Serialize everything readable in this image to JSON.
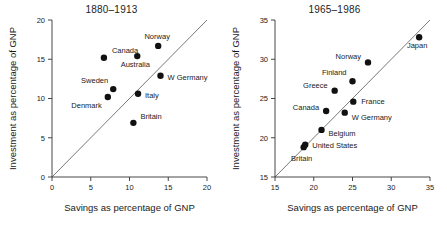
{
  "figure": {
    "background": "#ffffff",
    "point_color": "#111111",
    "axis_color": "#333333",
    "diagonal_color": "#555555"
  },
  "chart_data": [
    {
      "type": "scatter",
      "title": "1880–1913",
      "xlabel": "Savings as percentage of GNP",
      "ylabel": "Investment as percentage of GNP",
      "xlim": [
        0,
        20
      ],
      "ylim": [
        0,
        20
      ],
      "xticks": [
        0,
        5,
        10,
        15,
        20
      ],
      "yticks": [
        0,
        5,
        10,
        15,
        20
      ],
      "xtick_labels": [
        "0",
        "5",
        "10",
        "15",
        "20"
      ],
      "ytick_labels": [
        "0",
        "5",
        "10",
        "15",
        "20"
      ],
      "grid": false,
      "legend": "none",
      "annotations": [
        {
          "text": "45-degree reference line",
          "type": "identity-line",
          "from": [
            0,
            0
          ],
          "to": [
            20,
            20
          ]
        }
      ],
      "points": [
        {
          "label": "Canada",
          "x": 6.7,
          "y": 15.2,
          "label_dx": 8,
          "label_dy": -5,
          "anchor": "start"
        },
        {
          "label": "Denmark",
          "x": 7.2,
          "y": 10.2,
          "label_dx": -6,
          "label_dy": 11,
          "anchor": "end"
        },
        {
          "label": "Sweden",
          "x": 7.9,
          "y": 11.2,
          "label_dx": -5,
          "label_dy": -6,
          "anchor": "end"
        },
        {
          "label": "Australia",
          "x": 11.0,
          "y": 15.4,
          "label_dx": -2,
          "label_dy": 11,
          "anchor": "middle"
        },
        {
          "label": "Italy",
          "x": 11.1,
          "y": 10.6,
          "label_dx": 7,
          "label_dy": 4,
          "anchor": "start"
        },
        {
          "label": "Britain",
          "x": 10.5,
          "y": 6.9,
          "label_dx": 7,
          "label_dy": -4,
          "anchor": "start"
        },
        {
          "label": "Norway",
          "x": 13.7,
          "y": 16.7,
          "label_dx": -1,
          "label_dy": -7,
          "anchor": "middle"
        },
        {
          "label": "W Germany",
          "x": 14.0,
          "y": 12.9,
          "label_dx": 7,
          "label_dy": 4,
          "anchor": "start"
        }
      ]
    },
    {
      "type": "scatter",
      "title": "1965–1986",
      "xlabel": "Savings as percentage of GNP",
      "ylabel": "Investment as percentage of GNP",
      "xlim": [
        15,
        35
      ],
      "ylim": [
        15,
        35
      ],
      "xticks": [
        15,
        20,
        25,
        30,
        35
      ],
      "yticks": [
        15,
        20,
        25,
        30,
        35
      ],
      "xtick_labels": [
        "15",
        "20",
        "25",
        "30",
        "35"
      ],
      "ytick_labels": [
        "15",
        "20",
        "25",
        "30",
        "35"
      ],
      "grid": false,
      "legend": "none",
      "annotations": [
        {
          "text": "45-degree reference line",
          "type": "identity-line",
          "from": [
            15,
            15
          ],
          "to": [
            35,
            35
          ]
        }
      ],
      "points": [
        {
          "label": "Britain",
          "x": 18.7,
          "y": 18.8,
          "label_dx": -2,
          "label_dy": 14,
          "anchor": "middle"
        },
        {
          "label": "United States",
          "x": 18.9,
          "y": 19.1,
          "label_dx": 7,
          "label_dy": 3,
          "anchor": "start"
        },
        {
          "label": "Belgium",
          "x": 21.0,
          "y": 21.0,
          "label_dx": 7,
          "label_dy": 6,
          "anchor": "start"
        },
        {
          "label": "Canada",
          "x": 21.6,
          "y": 23.4,
          "label_dx": -7,
          "label_dy": -1,
          "anchor": "end"
        },
        {
          "label": "Greece",
          "x": 22.7,
          "y": 26.0,
          "label_dx": -7,
          "label_dy": -3,
          "anchor": "end"
        },
        {
          "label": "W Germany",
          "x": 24.0,
          "y": 23.2,
          "label_dx": 7,
          "label_dy": 7,
          "anchor": "start"
        },
        {
          "label": "France",
          "x": 25.1,
          "y": 24.6,
          "label_dx": 8,
          "label_dy": 2,
          "anchor": "start"
        },
        {
          "label": "Finland",
          "x": 25.0,
          "y": 27.2,
          "label_dx": -6,
          "label_dy": -6,
          "anchor": "end"
        },
        {
          "label": "Norway",
          "x": 27.0,
          "y": 29.6,
          "label_dx": -7,
          "label_dy": -3,
          "anchor": "end"
        },
        {
          "label": "Japan",
          "x": 33.6,
          "y": 32.8,
          "label_dx": -2,
          "label_dy": 11,
          "anchor": "middle"
        }
      ]
    }
  ]
}
